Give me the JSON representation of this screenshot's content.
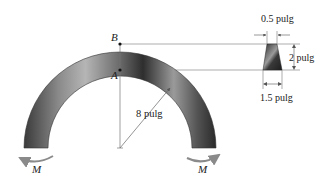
{
  "figure": {
    "type": "curved-beam-diagram",
    "points": {
      "outer_point": "B",
      "inner_point": "A"
    },
    "moment_label_left": "M",
    "moment_label_right": "M",
    "radius_label": "8 pulg",
    "section": {
      "top_width": "0.5 pulg",
      "height": "2 pulg",
      "bottom_width": "1.5 pulg"
    }
  },
  "colors": {
    "beam_dark": "#2a2a2a",
    "beam_light": "#bdbdbd",
    "line": "#777777",
    "arrow": "#8a8a8a"
  }
}
